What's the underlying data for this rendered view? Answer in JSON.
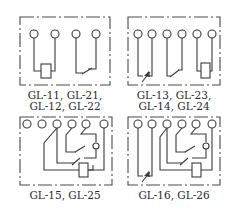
{
  "diagram": {
    "panels": [
      {
        "id": "panel-1",
        "labels": [
          "GL-11, GL-21,",
          "GL-12, GL-22"
        ],
        "terminals": 4,
        "elements": [
          "coil",
          "normally-open contact"
        ]
      },
      {
        "id": "panel-2",
        "labels": [
          "GL-13, GL-23,",
          "GL-14, GL-24"
        ],
        "terminals": 6,
        "elements": [
          "flag/indicator contact",
          "normally-open contact",
          "coil"
        ]
      },
      {
        "id": "panel-3",
        "labels": [
          "GL-15, GL-25"
        ],
        "terminals": 6,
        "elements": [
          "changeover contact",
          "normally-open contact",
          "coil"
        ]
      },
      {
        "id": "panel-4",
        "labels": [
          "GL-16, GL-26"
        ],
        "terminals": 6,
        "elements": [
          "flag/indicator contact",
          "changeover contact",
          "normally-open contact",
          "coil"
        ]
      }
    ],
    "colors": {
      "line": "#3a3a3a",
      "background": "#ffffff"
    }
  }
}
